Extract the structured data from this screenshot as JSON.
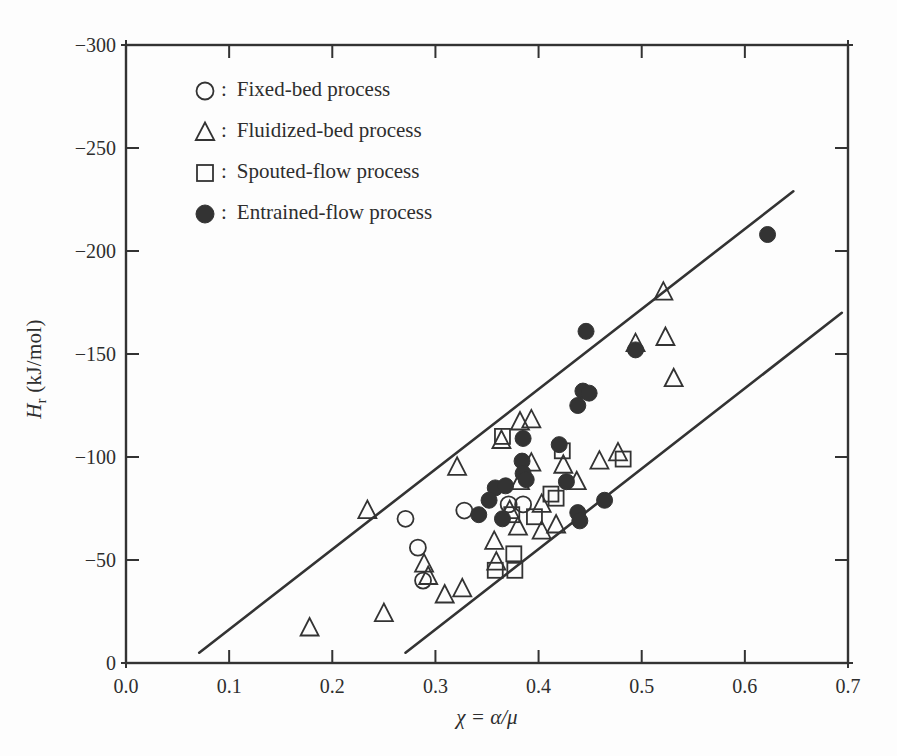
{
  "chart_data": {
    "type": "scatter",
    "title": "",
    "xlabel": "χ = α/μ",
    "ylabel_variable": "H",
    "ylabel_subscript": "r",
    "ylabel_unit": "(kJ/mol)",
    "xlim": [
      0.0,
      0.7
    ],
    "ylim": [
      0,
      -300
    ],
    "x_ticks": [
      0.0,
      0.1,
      0.2,
      0.3,
      0.4,
      0.5,
      0.6,
      0.7
    ],
    "x_tick_labels": [
      "0.0",
      "0.1",
      "0.2",
      "0.3",
      "0.4",
      "0.5",
      "0.6",
      "0.7"
    ],
    "y_ticks": [
      0,
      -50,
      -100,
      -150,
      -200,
      -250,
      -300
    ],
    "y_tick_labels": [
      "0",
      "−50",
      "−100",
      "−150",
      "−200",
      "−250",
      "−300"
    ],
    "grid": false,
    "legend_position": "upper-left-inside",
    "legend_separator": ":",
    "legend": [
      {
        "marker": "circle-open",
        "label": "Fixed-bed process"
      },
      {
        "marker": "triangle-open",
        "label": "Fluidized-bed process"
      },
      {
        "marker": "square-open",
        "label": "Spouted-flow process"
      },
      {
        "marker": "circle-filled",
        "label": "Entrained-flow process"
      }
    ],
    "series": [
      {
        "name": "Fixed-bed process",
        "marker": "circle-open",
        "points": [
          [
            0.271,
            -70
          ],
          [
            0.283,
            -56
          ],
          [
            0.288,
            -40
          ],
          [
            0.328,
            -74
          ],
          [
            0.371,
            -77
          ],
          [
            0.385,
            -77
          ]
        ]
      },
      {
        "name": "Fluidized-bed process",
        "marker": "triangle-open",
        "points": [
          [
            0.178,
            -17
          ],
          [
            0.25,
            -24
          ],
          [
            0.234,
            -74
          ],
          [
            0.289,
            -48
          ],
          [
            0.293,
            -42
          ],
          [
            0.309,
            -33
          ],
          [
            0.326,
            -36
          ],
          [
            0.321,
            -95
          ],
          [
            0.357,
            -59
          ],
          [
            0.359,
            -49
          ],
          [
            0.372,
            -74
          ],
          [
            0.38,
            -66
          ],
          [
            0.382,
            -117
          ],
          [
            0.393,
            -118
          ],
          [
            0.364,
            -108
          ],
          [
            0.393,
            -97
          ],
          [
            0.382,
            -88
          ],
          [
            0.403,
            -64
          ],
          [
            0.417,
            -67
          ],
          [
            0.403,
            -77
          ],
          [
            0.424,
            -96
          ],
          [
            0.437,
            -88
          ],
          [
            0.459,
            -98
          ],
          [
            0.477,
            -102
          ],
          [
            0.494,
            -155
          ],
          [
            0.523,
            -158
          ],
          [
            0.521,
            -180
          ],
          [
            0.531,
            -138
          ]
        ]
      },
      {
        "name": "Spouted-flow process",
        "marker": "square-open",
        "points": [
          [
            0.365,
            -110
          ],
          [
            0.423,
            -103
          ],
          [
            0.374,
            -72
          ],
          [
            0.396,
            -71
          ],
          [
            0.412,
            -82
          ],
          [
            0.417,
            -80
          ],
          [
            0.376,
            -53
          ],
          [
            0.358,
            -45
          ],
          [
            0.377,
            -45
          ],
          [
            0.482,
            -99
          ]
        ]
      },
      {
        "name": "Entrained-flow process",
        "marker": "circle-filled",
        "points": [
          [
            0.622,
            -208
          ],
          [
            0.446,
            -161
          ],
          [
            0.494,
            -152
          ],
          [
            0.443,
            -132
          ],
          [
            0.449,
            -131
          ],
          [
            0.438,
            -125
          ],
          [
            0.42,
            -106
          ],
          [
            0.385,
            -109
          ],
          [
            0.384,
            -98
          ],
          [
            0.385,
            -92
          ],
          [
            0.388,
            -89
          ],
          [
            0.427,
            -88
          ],
          [
            0.358,
            -85
          ],
          [
            0.368,
            -86
          ],
          [
            0.352,
            -79
          ],
          [
            0.365,
            -70
          ],
          [
            0.342,
            -72
          ],
          [
            0.464,
            -79
          ],
          [
            0.438,
            -73
          ],
          [
            0.44,
            -69
          ]
        ]
      }
    ],
    "boundary_lines": [
      {
        "x1": 0.071,
        "y1": -5,
        "x2": 0.647,
        "y2": -229
      },
      {
        "x1": 0.271,
        "y1": -5,
        "x2": 0.694,
        "y2": -170
      }
    ],
    "colors": {
      "ink": "#333333",
      "background": "#fdfdfd"
    }
  }
}
